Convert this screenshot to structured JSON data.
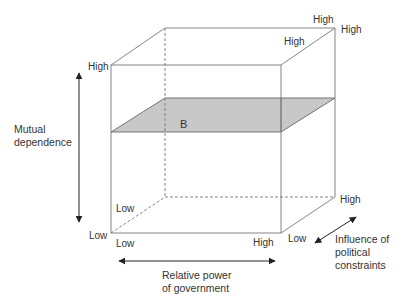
{
  "diagram": {
    "plane_label": "B",
    "axes": {
      "vertical": {
        "label_lines": [
          "Mutual",
          "dependence"
        ],
        "high": "High",
        "low": "Low"
      },
      "horizontal": {
        "label_lines": [
          "Relative power",
          "of government"
        ],
        "low": "Low",
        "high": "High"
      },
      "depth": {
        "label_lines": [
          "Influence of",
          "political",
          "constraints"
        ],
        "low": "Low",
        "high": "High"
      }
    },
    "corner_labels": {
      "back_top_left_high": "High",
      "back_top_right_high_a": "High",
      "back_top_right_high_b": "High",
      "back_bottom_left_low": "Low",
      "back_bottom_right_high": "High"
    },
    "colors": {
      "line": "#777777",
      "plane_fill": "#c8c8c8",
      "plane_edge": "#666666",
      "arrow": "#222222",
      "text": "#333333"
    }
  }
}
